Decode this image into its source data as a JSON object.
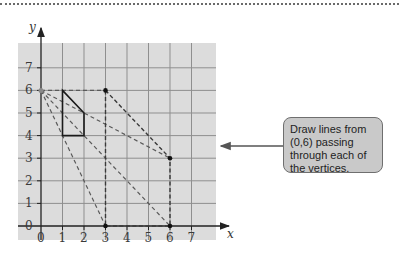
{
  "diagram": {
    "axes": {
      "x_label": "x",
      "y_label": "y",
      "x_ticks": [
        "0",
        "1",
        "2",
        "3",
        "4",
        "5",
        "6",
        "7"
      ],
      "y_ticks": [
        "0",
        "1",
        "2",
        "3",
        "4",
        "5",
        "6",
        "7"
      ],
      "range": {
        "x": [
          0,
          7
        ],
        "y": [
          0,
          7
        ]
      }
    },
    "center_of_enlargement": [
      0,
      6
    ],
    "original_shape": {
      "vertices": [
        [
          1,
          6
        ],
        [
          2,
          5
        ],
        [
          2,
          4
        ],
        [
          1,
          4
        ]
      ],
      "style": "solid"
    },
    "image_shape": {
      "vertices": [
        [
          3,
          6
        ],
        [
          6,
          3
        ],
        [
          6,
          0
        ],
        [
          3,
          0
        ]
      ],
      "marked_points": [
        [
          3,
          6
        ],
        [
          6,
          3
        ],
        [
          6,
          0
        ],
        [
          3,
          0
        ]
      ],
      "style": "dashed"
    },
    "rays_from_center": [
      [
        3,
        6
      ],
      [
        6,
        3
      ],
      [
        6,
        0
      ],
      [
        3,
        0
      ]
    ],
    "callout": {
      "text": "Draw lines from (0,6) passing through each of the vertices."
    },
    "colors": {
      "grid_background": "#dcdcdc",
      "grid_lines": "#8c8c8c",
      "callout_fill": "#c9c9c9",
      "shape_line": "#1a1a1a",
      "dashed_line": "#555555"
    }
  }
}
